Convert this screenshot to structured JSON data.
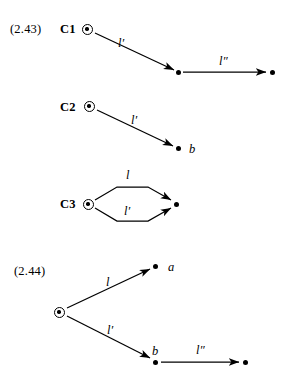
{
  "figure": {
    "type": "commutative-diagram",
    "background_color": "#ffffff",
    "ink_color": "#000000"
  },
  "equations": [
    {
      "id": "eq-2-43",
      "number": "(2.43)",
      "number_position": {
        "x": 10,
        "y": 23
      },
      "rows": [
        {
          "id": "row-c1",
          "object_label": "C1",
          "object_label_position": {
            "x": 60,
            "y": 23
          },
          "source_node": {
            "kind": "circled-dot",
            "x": 87,
            "y": 29
          },
          "nodes": [
            {
              "kind": "circled-dot",
              "name": "source",
              "x": 87,
              "y": 29
            },
            {
              "kind": "dot",
              "name": "middle",
              "x": 178,
              "y": 72
            },
            {
              "kind": "dot",
              "name": "target",
              "x": 272,
              "y": 72
            }
          ],
          "arrows": [
            {
              "name": "arrow-l-prime",
              "label": "l′",
              "from": {
                "x": 95,
                "y": 33
              },
              "to": {
                "x": 174,
                "y": 70
              },
              "label_position": {
                "x": 118,
                "y": 37
              }
            },
            {
              "name": "arrow-l-double-prime",
              "label": "l″",
              "from": {
                "x": 183,
                "y": 72
              },
              "to": {
                "x": 267,
                "y": 72
              },
              "label_position": {
                "x": 219,
                "y": 55
              }
            }
          ]
        },
        {
          "id": "row-c2",
          "object_label": "C2",
          "object_label_position": {
            "x": 60,
            "y": 101
          },
          "nodes": [
            {
              "kind": "circled-dot",
              "name": "source",
              "x": 89,
              "y": 106
            },
            {
              "kind": "dot",
              "name": "target",
              "x": 178,
              "y": 148
            }
          ],
          "arrows": [
            {
              "name": "arrow-l-prime",
              "label": "l′",
              "from": {
                "x": 97,
                "y": 110
              },
              "to": {
                "x": 173,
                "y": 146
              },
              "label_position": {
                "x": 131,
                "y": 114
              }
            }
          ],
          "vertex_labels": [
            {
              "name": "vertex-label-b",
              "text": "b",
              "x": 189,
              "y": 143
            }
          ]
        },
        {
          "id": "row-c3",
          "object_label": "C3",
          "object_label_position": {
            "x": 60,
            "y": 198
          },
          "nodes": [
            {
              "kind": "circled-dot",
              "name": "source",
              "x": 88,
              "y": 204
            },
            {
              "kind": "dot",
              "name": "target",
              "x": 176,
              "y": 204
            }
          ],
          "arrows": [
            {
              "name": "arrow-l-upper",
              "label": "l",
              "path": "upper-arc",
              "label_position": {
                "x": 126,
                "y": 169
              }
            },
            {
              "name": "arrow-l-prime-lower",
              "label": "l′",
              "path": "lower-arc",
              "label_position": {
                "x": 124,
                "y": 205
              }
            }
          ]
        }
      ]
    },
    {
      "id": "eq-2-44",
      "number": "(2.44)",
      "number_position": {
        "x": 14,
        "y": 265
      },
      "nodes": [
        {
          "kind": "circled-dot",
          "name": "source",
          "x": 59,
          "y": 312
        },
        {
          "kind": "dot",
          "name": "node-a",
          "x": 155,
          "y": 266
        },
        {
          "kind": "dot",
          "name": "node-b",
          "x": 155,
          "y": 362
        },
        {
          "kind": "dot",
          "name": "node-target",
          "x": 245,
          "y": 362
        }
      ],
      "arrows": [
        {
          "name": "arrow-l",
          "label": "l",
          "from": {
            "x": 67,
            "y": 308
          },
          "to": {
            "x": 150,
            "y": 269
          },
          "label_position": {
            "x": 106,
            "y": 276
          }
        },
        {
          "name": "arrow-l-prime",
          "label": "l′",
          "from": {
            "x": 67,
            "y": 316
          },
          "to": {
            "x": 150,
            "y": 359
          },
          "label_position": {
            "x": 107,
            "y": 324
          }
        },
        {
          "name": "arrow-l-double-prime",
          "label": "l″",
          "from": {
            "x": 161,
            "y": 362
          },
          "to": {
            "x": 240,
            "y": 362
          },
          "label_position": {
            "x": 196,
            "y": 344
          }
        }
      ],
      "vertex_labels": [
        {
          "name": "vertex-label-a",
          "text": "a",
          "x": 168,
          "y": 261
        },
        {
          "name": "vertex-label-b",
          "text": "b",
          "x": 152,
          "y": 345
        }
      ]
    }
  ]
}
